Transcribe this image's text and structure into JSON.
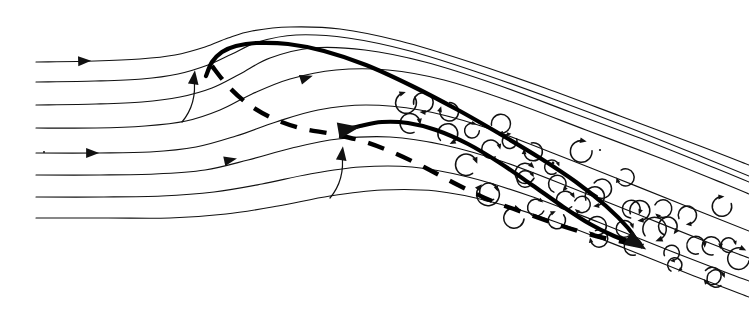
{
  "figure": {
    "caption": "",
    "background_color": "#ffffff",
    "ink_color": "#111111",
    "width": 749,
    "height": 314
  },
  "legend_items": [
    {
      "key": "streamline",
      "label": "streamline",
      "style": "thin solid line"
    },
    {
      "key": "shear-layer",
      "label": "separated shear layer",
      "style": "thick solid line"
    },
    {
      "key": "separation-line",
      "label": "dividing / separation streamline",
      "style": "thick dashed line"
    },
    {
      "key": "eddy",
      "label": "turbulent eddy",
      "style": "small curled vortex hook"
    }
  ],
  "chart_data": {
    "type": "line",
    "subtitle": "",
    "xlabel": "",
    "ylabel": "",
    "xlim": [
      0,
      749
    ],
    "ylim": [
      0,
      314
    ],
    "grid": false,
    "legend_position": "none",
    "note": "Coordinates are in image pixel space; y increases downward.",
    "series": [
      {
        "name": "streamline-1",
        "role": "free-stream streamline (topmost)",
        "stroke_width": 1.15,
        "points": [
          [
            36,
            62
          ],
          [
            95,
            61
          ],
          [
            140,
            59
          ],
          [
            175,
            55
          ],
          [
            205,
            47
          ],
          [
            228,
            38
          ],
          [
            252,
            31
          ],
          [
            290,
            27
          ],
          [
            340,
            29
          ],
          [
            400,
            41
          ],
          [
            470,
            62
          ],
          [
            545,
            88
          ],
          [
            620,
            116
          ],
          [
            700,
            146
          ],
          [
            749,
            165
          ]
        ]
      },
      {
        "name": "streamline-2",
        "role": "free-stream streamline",
        "stroke_width": 1.15,
        "points": [
          [
            36,
            82
          ],
          [
            95,
            81
          ],
          [
            142,
            79
          ],
          [
            178,
            74
          ],
          [
            208,
            65
          ],
          [
            232,
            54
          ],
          [
            258,
            42
          ],
          [
            296,
            35
          ],
          [
            348,
            38
          ],
          [
            410,
            51
          ],
          [
            480,
            73
          ],
          [
            556,
            100
          ],
          [
            630,
            128
          ],
          [
            705,
            158
          ],
          [
            749,
            176
          ]
        ]
      },
      {
        "name": "streamline-3",
        "role": "free-stream streamline",
        "stroke_width": 1.15,
        "points": [
          [
            36,
            105
          ],
          [
            96,
            104
          ],
          [
            142,
            102
          ],
          [
            180,
            97
          ],
          [
            212,
            88
          ],
          [
            240,
            74
          ],
          [
            270,
            58
          ],
          [
            312,
            48
          ],
          [
            365,
            50
          ],
          [
            425,
            62
          ],
          [
            495,
            84
          ],
          [
            570,
            112
          ],
          [
            645,
            140
          ],
          [
            715,
            168
          ],
          [
            749,
            182
          ]
        ]
      },
      {
        "name": "streamline-4",
        "role": "streamline passing over upper bubble",
        "stroke_width": 1.15,
        "points": [
          [
            36,
            128
          ],
          [
            96,
            128
          ],
          [
            145,
            126
          ],
          [
            186,
            121
          ],
          [
            220,
            110
          ],
          [
            252,
            94
          ],
          [
            290,
            79
          ],
          [
            336,
            70
          ],
          [
            388,
            70
          ],
          [
            444,
            80
          ],
          [
            512,
            102
          ],
          [
            586,
            130
          ],
          [
            660,
            158
          ],
          [
            725,
            184
          ],
          [
            749,
            194
          ]
        ]
      },
      {
        "name": "streamline-5",
        "role": "streamline over the secondary bubble",
        "stroke_width": 1.15,
        "points": [
          [
            36,
            153
          ],
          [
            98,
            153
          ],
          [
            150,
            152
          ],
          [
            196,
            147
          ],
          [
            236,
            136
          ],
          [
            276,
            122
          ],
          [
            318,
            110
          ],
          [
            366,
            105
          ],
          [
            420,
            110
          ],
          [
            478,
            125
          ],
          [
            545,
            150
          ],
          [
            616,
            178
          ],
          [
            686,
            206
          ],
          [
            749,
            231
          ]
        ]
      },
      {
        "name": "streamline-6",
        "role": "streamline beneath secondary bubble",
        "stroke_width": 1.15,
        "points": [
          [
            36,
            175
          ],
          [
            100,
            175
          ],
          [
            155,
            174
          ],
          [
            205,
            170
          ],
          [
            248,
            160
          ],
          [
            292,
            148
          ],
          [
            338,
            139
          ],
          [
            390,
            137
          ],
          [
            444,
            145
          ],
          [
            504,
            162
          ],
          [
            572,
            188
          ],
          [
            642,
            216
          ],
          [
            712,
            244
          ],
          [
            749,
            258
          ]
        ]
      },
      {
        "name": "streamline-7",
        "role": "near-wall streamline",
        "stroke_width": 1.15,
        "points": [
          [
            36,
            197
          ],
          [
            104,
            197
          ],
          [
            162,
            196
          ],
          [
            214,
            192
          ],
          [
            262,
            184
          ],
          [
            310,
            174
          ],
          [
            360,
            167
          ],
          [
            412,
            167
          ],
          [
            468,
            177
          ],
          [
            530,
            196
          ],
          [
            598,
            222
          ],
          [
            668,
            250
          ],
          [
            730,
            274
          ],
          [
            749,
            281
          ]
        ]
      },
      {
        "name": "streamline-8",
        "role": "wall / lowest streamline",
        "stroke_width": 1.15,
        "points": [
          [
            36,
            218
          ],
          [
            108,
            218
          ],
          [
            170,
            218
          ],
          [
            226,
            214
          ],
          [
            278,
            206
          ],
          [
            330,
            196
          ],
          [
            382,
            190
          ],
          [
            436,
            191
          ],
          [
            492,
            202
          ],
          [
            556,
            222
          ],
          [
            624,
            248
          ],
          [
            694,
            276
          ],
          [
            749,
            297
          ]
        ]
      },
      {
        "name": "shear-layer-upper",
        "role": "thick separated shear layer from the upper bubble",
        "stroke_width": 4.2,
        "points": [
          [
            206,
            76
          ],
          [
            212,
            62
          ],
          [
            222,
            52
          ],
          [
            236,
            46
          ],
          [
            256,
            43
          ],
          [
            288,
            44
          ],
          [
            324,
            51
          ],
          [
            366,
            65
          ],
          [
            412,
            86
          ],
          [
            458,
            110
          ],
          [
            500,
            134
          ],
          [
            540,
            158
          ],
          [
            576,
            182
          ],
          [
            606,
            206
          ],
          [
            628,
            228
          ],
          [
            638,
            243
          ]
        ]
      },
      {
        "name": "shear-layer-lower",
        "role": "thick separated shear layer from the secondary bubble",
        "stroke_width": 4.2,
        "points": [
          [
            342,
            131
          ],
          [
            360,
            126
          ],
          [
            382,
            122
          ],
          [
            408,
            123
          ],
          [
            436,
            130
          ],
          [
            468,
            144
          ],
          [
            500,
            163
          ],
          [
            532,
            185
          ],
          [
            562,
            206
          ],
          [
            590,
            224
          ],
          [
            614,
            236
          ],
          [
            634,
            243
          ]
        ]
      },
      {
        "name": "separation-line",
        "role": "dashed dividing streamline from upper crest to reattachment",
        "stroke_width": 4.4,
        "dashed": true,
        "points": [
          [
            212,
            66
          ],
          [
            228,
            86
          ],
          [
            248,
            104
          ],
          [
            272,
            118
          ],
          [
            300,
            128
          ],
          [
            332,
            134
          ],
          [
            362,
            141
          ],
          [
            392,
            152
          ],
          [
            424,
            167
          ],
          [
            458,
            185
          ],
          [
            492,
            201
          ],
          [
            528,
            214
          ],
          [
            562,
            226
          ],
          [
            596,
            236
          ],
          [
            624,
            242
          ],
          [
            640,
            245
          ]
        ]
      }
    ],
    "annotations": [
      {
        "type": "arrowhead",
        "name": "flow-arrow-top",
        "x": 84,
        "y": 61,
        "angle": -2,
        "meaning": "free-stream direction"
      },
      {
        "type": "arrowhead",
        "name": "flow-arrow-mid",
        "x": 92,
        "y": 153,
        "angle": 0,
        "meaning": "free-stream direction"
      },
      {
        "type": "arrowhead",
        "name": "flow-arrow-mid-2",
        "x": 230,
        "y": 160,
        "angle": -12,
        "meaning": "accelerating flow"
      },
      {
        "type": "arrowhead",
        "name": "flow-arrow-upper-right",
        "x": 306,
        "y": 78,
        "angle": -18,
        "meaning": "flow over crest"
      },
      {
        "type": "curved-arrow",
        "name": "upwash-arrow-left",
        "x": 186,
        "y": 76,
        "meaning": "upwash into upper separation bubble"
      },
      {
        "type": "curved-arrow",
        "name": "upwash-arrow-right",
        "x": 334,
        "y": 152,
        "meaning": "upwash into secondary separation bubble"
      },
      {
        "type": "arrowhead",
        "name": "reattachment-arrow",
        "x": 636,
        "y": 243,
        "angle": 32,
        "meaning": "shear layer reattachment"
      },
      {
        "type": "arrowhead",
        "name": "secondary-start-arrow",
        "x": 348,
        "y": 129,
        "angle": -10,
        "meaning": "start of secondary shear layer"
      }
    ],
    "eddy_rows": [
      {
        "name": "eddy-row-upper",
        "description": "turbulent eddies in the upper shear layer band",
        "count": 16,
        "start": [
          405,
          99
        ],
        "end": [
          735,
          228
        ],
        "radii": [
          7,
          11
        ]
      },
      {
        "name": "eddy-row-lower",
        "description": "turbulent eddies in the lower shear layer band",
        "count": 13,
        "start": [
          470,
          170
        ],
        "end": [
          738,
          274
        ],
        "radii": [
          7,
          12
        ]
      }
    ]
  }
}
